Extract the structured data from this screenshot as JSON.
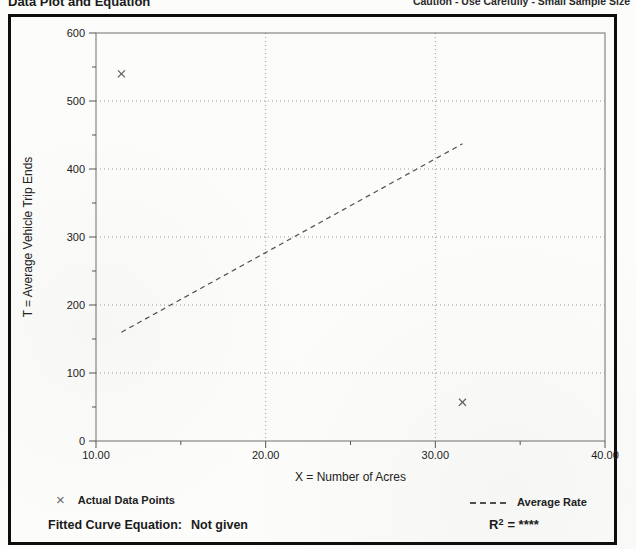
{
  "header": {
    "title": "Data Plot and Equation",
    "caution": "Caution - Use Carefully - Small Sample Size"
  },
  "chart_data": {
    "type": "scatter",
    "title": "Data Plot and Equation",
    "xlabel": "X = Number of Acres",
    "ylabel": "T = Average Vehicle Trip Ends",
    "xlim": [
      10,
      40
    ],
    "ylim": [
      0,
      600
    ],
    "x_major_ticks": [
      10,
      20,
      30,
      40
    ],
    "x_tick_labels": [
      "10.00",
      "20.00",
      "30.00",
      "40.00"
    ],
    "x_minor_ticks": [
      15,
      25,
      35
    ],
    "y_major_ticks": [
      0,
      100,
      200,
      300,
      400,
      500,
      600
    ],
    "y_tick_labels": [
      "0",
      "100",
      "200",
      "300",
      "400",
      "500",
      "600"
    ],
    "y_minor_ticks": [
      50,
      150,
      250,
      350,
      450,
      550
    ],
    "x_gridlines": [
      20,
      30
    ],
    "y_gridlines": [
      100,
      200,
      300,
      400,
      500
    ],
    "grid_style": "dotted",
    "points": [
      {
        "x": 11.5,
        "y": 540
      },
      {
        "x": 31.6,
        "y": 57
      }
    ],
    "series": [
      {
        "name": "Actual Data Points",
        "marker": "x",
        "points": [
          [
            11.5,
            540
          ],
          [
            31.6,
            57
          ]
        ]
      },
      {
        "name": "Average Rate",
        "style": "dashed-line",
        "points": [
          [
            11.5,
            160
          ],
          [
            31.6,
            437
          ]
        ]
      }
    ],
    "average_rate_line": {
      "x1": 11.5,
      "y1": 160,
      "x2": 31.6,
      "y2": 437
    },
    "legend_position": "below"
  },
  "legend": {
    "marker_glyph": "×",
    "points_label": "Actual Data Points",
    "line_label": "Average Rate"
  },
  "footer": {
    "equation_label": "Fitted Curve Equation:",
    "equation_value": "Not given",
    "r2_base": "R",
    "r2_exp": "2",
    "r2_rest": "= ****"
  }
}
